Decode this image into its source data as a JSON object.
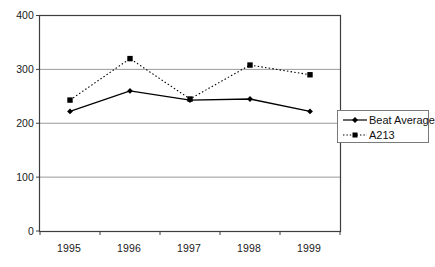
{
  "chart_data": {
    "type": "line",
    "title": "",
    "subtitle": "",
    "xlabel": "",
    "ylabel": "",
    "categories": [
      "1995",
      "1996",
      "1997",
      "1998",
      "1999"
    ],
    "series": [
      {
        "name": "Beat Average",
        "values": [
          222,
          260,
          243,
          245,
          222
        ],
        "line_style": "solid",
        "marker": "diamond",
        "color": "#000000"
      },
      {
        "name": "A213",
        "values": [
          243,
          320,
          245,
          308,
          290
        ],
        "line_style": "dotted",
        "marker": "square",
        "color": "#000000"
      }
    ],
    "ylim": [
      0,
      400
    ],
    "yticks": [
      0,
      100,
      200,
      300,
      400
    ],
    "ytick_labels": [
      "0",
      "100",
      "200",
      "300",
      "400"
    ],
    "xtick_labels": [
      "1995",
      "1996",
      "1997",
      "1998",
      "1999"
    ],
    "grid": {
      "horizontal": true,
      "vertical": false,
      "color": "#9a9a9a"
    },
    "legend": {
      "position": "right",
      "entries": [
        "Beat Average",
        "A213"
      ]
    },
    "plot_border_color": "#3d3d3d",
    "background": "#ffffff"
  },
  "axes": {
    "y_ticks": [
      {
        "label": "400",
        "value": 400
      },
      {
        "label": "300",
        "value": 300
      },
      {
        "label": "200",
        "value": 200
      },
      {
        "label": "100",
        "value": 100
      },
      {
        "label": "0",
        "value": 0
      }
    ],
    "x_ticks": [
      {
        "label": "1995"
      },
      {
        "label": "1996"
      },
      {
        "label": "1997"
      },
      {
        "label": "1998"
      },
      {
        "label": "1999"
      }
    ]
  },
  "legend": {
    "items": [
      {
        "label": "Beat Average",
        "marker": "diamond",
        "line": "solid"
      },
      {
        "label": "A213",
        "marker": "square",
        "line": "dotted"
      }
    ]
  }
}
